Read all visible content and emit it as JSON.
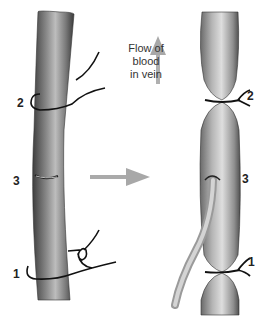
{
  "figure": {
    "flow_label": [
      "Flow of",
      "blood",
      "in vein"
    ],
    "left_panel": {
      "labels": {
        "ligature_2": "2",
        "incision_3": "3",
        "ligature_1": "1"
      }
    },
    "right_panel": {
      "labels": {
        "ligature_2": "2",
        "incision_3": "3",
        "ligature_1": "1"
      }
    },
    "colors": {
      "vein_dark": "#4a4a4a",
      "vein_mid": "#8a8a8a",
      "vein_light": "#c8c8c8",
      "arrow": "#a8a8a8",
      "suture": "#111111",
      "catheter": "#bdbdbd"
    }
  }
}
